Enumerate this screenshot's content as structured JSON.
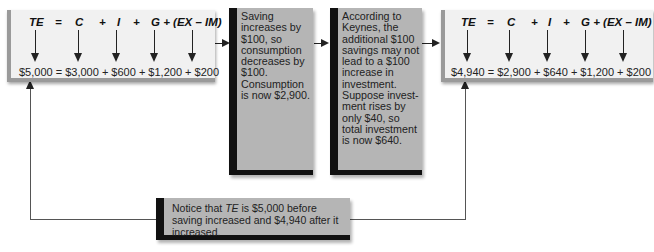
{
  "before": {
    "top": {
      "te": "TE",
      "eq": "=",
      "c": "C",
      "p1": "+",
      "i": "I",
      "p2": "+",
      "g": "G + (EX – IM)"
    },
    "values": "$5,000 = $3,000 + $600 + $1,200 + $200"
  },
  "step1": {
    "text": "Saving increases by $100, so consumption decreases by $100. Consumption is now $2,900."
  },
  "step2": {
    "text": "According to Keynes, the additional $100 savings may not lead to a $100 increase in investment. Suppose invest-ment rises by only $40, so total investment is now $640."
  },
  "after": {
    "top": {
      "te": "TE",
      "eq": "=",
      "c": "C",
      "p1": "+",
      "i": "I",
      "p2": "+",
      "g": "G + (EX – IM)"
    },
    "values": "$4,940 = $2,900 + $640 + $1,200 + $200"
  },
  "note": {
    "pre": "Notice that ",
    "te": "TE",
    "post": " is $5,000 before saving increased and $4,940 after it increased."
  }
}
